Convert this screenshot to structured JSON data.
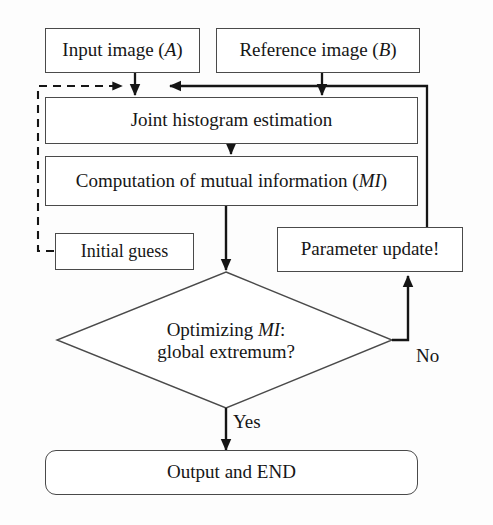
{
  "figure": {
    "kind": "flowchart",
    "background_color": "#fdfdfd",
    "stroke_color": "#4a4a4a",
    "arrow_color": "#151515",
    "text_color": "#161616"
  },
  "nodes": {
    "input_image": {
      "label": "Input image (A)",
      "text_main": "Input image (",
      "text_italic": "A",
      "text_tail": ")",
      "shape": "rectangle"
    },
    "reference_image": {
      "label": "Reference image (B)",
      "text_main": "Reference image (",
      "text_italic": "B",
      "text_tail": ")",
      "shape": "rectangle"
    },
    "joint_histogram": {
      "label": "Joint histogram estimation",
      "shape": "rectangle"
    },
    "computation_mi": {
      "label": "Computation of mutual information (MI)",
      "text_main": "Computation of mutual information (",
      "text_italic": "MI",
      "text_tail": ")",
      "shape": "rectangle"
    },
    "initial_guess": {
      "label": "Initial guess",
      "shape": "rectangle"
    },
    "parameter_update": {
      "label": "Parameter update!",
      "shape": "rectangle"
    },
    "decision": {
      "label": "Optimizing MI: global extremum?",
      "line1_main": "Optimizing ",
      "line1_italic": "MI",
      "line1_tail": ":",
      "line2": "global extremum?",
      "shape": "diamond"
    },
    "output_end": {
      "label": "Output and END",
      "shape": "rounded-rectangle"
    }
  },
  "edge_labels": {
    "yes": "Yes",
    "no": "No"
  },
  "edges": [
    {
      "name": "input-to-joint",
      "from": "input_image",
      "to": "joint_histogram",
      "style": "solid",
      "arrow": true
    },
    {
      "name": "reference-to-joint",
      "from": "reference_image",
      "to": "joint_histogram",
      "style": "solid",
      "arrow": true
    },
    {
      "name": "initial-guess-feedback",
      "from": "initial_guess",
      "to": "joint_histogram",
      "style": "dashed",
      "arrow": true
    },
    {
      "name": "joint-to-computation",
      "from": "joint_histogram",
      "to": "computation_mi",
      "style": "solid",
      "arrow": true
    },
    {
      "name": "computation-to-decision",
      "from": "computation_mi",
      "to": "decision",
      "style": "solid",
      "arrow": true
    },
    {
      "name": "decision-no-to-parameter-update",
      "from": "decision",
      "to": "parameter_update",
      "style": "solid",
      "arrow": true,
      "label": "No"
    },
    {
      "name": "parameter-update-to-joint",
      "from": "parameter_update",
      "to": "joint_histogram",
      "style": "solid",
      "arrow": true
    },
    {
      "name": "decision-yes-to-output",
      "from": "decision",
      "to": "output_end",
      "style": "solid",
      "arrow": true,
      "label": "Yes"
    }
  ]
}
